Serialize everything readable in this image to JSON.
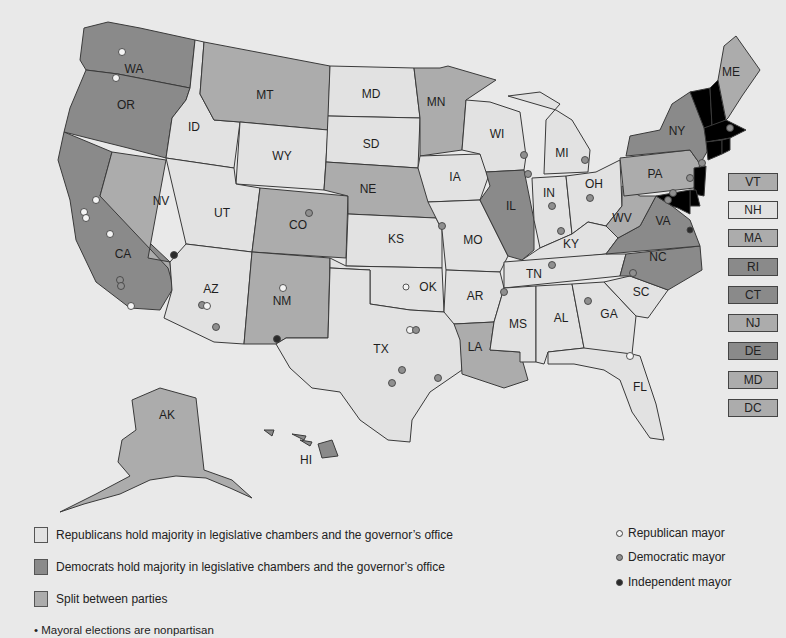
{
  "colors": {
    "republican": "#e2e2e2",
    "democrat": "#8a8a8a",
    "split": "#acacac",
    "background": "#e9e9e9",
    "republican_mayor": "#f4f4f4",
    "democratic_mayor": "#8f8f8f",
    "independent_mayor": "#2a2a2a"
  },
  "map": {
    "states": {
      "WA": {
        "label": "WA",
        "control": "democrat"
      },
      "OR": {
        "label": "OR",
        "control": "democrat"
      },
      "CA": {
        "label": "CA",
        "control": "democrat"
      },
      "NV": {
        "label": "NV",
        "control": "split"
      },
      "ID": {
        "label": "ID",
        "control": "republican"
      },
      "MT": {
        "label": "MT",
        "control": "split"
      },
      "WY": {
        "label": "WY",
        "control": "republican"
      },
      "UT": {
        "label": "UT",
        "control": "republican"
      },
      "AZ": {
        "label": "AZ",
        "control": "republican"
      },
      "CO": {
        "label": "CO",
        "control": "split"
      },
      "NM": {
        "label": "NM",
        "control": "split"
      },
      "ND": {
        "label": "MD",
        "control": "republican"
      },
      "SD": {
        "label": "SD",
        "control": "republican"
      },
      "NE": {
        "label": "NE",
        "control": "split"
      },
      "KS": {
        "label": "KS",
        "control": "republican"
      },
      "OK": {
        "label": "OK",
        "control": "republican"
      },
      "TX": {
        "label": "TX",
        "control": "republican"
      },
      "MN": {
        "label": "MN",
        "control": "split"
      },
      "IA": {
        "label": "IA",
        "control": "republican"
      },
      "MO": {
        "label": "MO",
        "control": "republican"
      },
      "AR": {
        "label": "AR",
        "control": "republican"
      },
      "LA": {
        "label": "LA",
        "control": "split"
      },
      "WI": {
        "label": "WI",
        "control": "republican"
      },
      "IL": {
        "label": "IL",
        "control": "democrat"
      },
      "MI": {
        "label": "MI",
        "control": "republican"
      },
      "IN": {
        "label": "IN",
        "control": "republican"
      },
      "OH": {
        "label": "OH",
        "control": "republican"
      },
      "KY": {
        "label": "KY",
        "control": "republican"
      },
      "TN": {
        "label": "TN",
        "control": "republican"
      },
      "MS": {
        "label": "MS",
        "control": "republican"
      },
      "AL": {
        "label": "AL",
        "control": "republican"
      },
      "GA": {
        "label": "GA",
        "control": "republican"
      },
      "FL": {
        "label": "FL",
        "control": "republican"
      },
      "SC": {
        "label": "SC",
        "control": "republican"
      },
      "NC": {
        "label": "NC",
        "control": "democrat"
      },
      "VA": {
        "label": "VA",
        "control": "democrat"
      },
      "WV": {
        "label": "WV",
        "control": "split"
      },
      "PA": {
        "label": "PA",
        "control": "split"
      },
      "NY": {
        "label": "NY",
        "control": "democrat"
      },
      "ME": {
        "label": "ME",
        "control": "split"
      },
      "AK": {
        "label": "AK",
        "control": "split"
      },
      "HI": {
        "label": "HI",
        "control": "democrat"
      }
    },
    "northeast_boxes": [
      {
        "label": "VT",
        "control": "split"
      },
      {
        "label": "NH",
        "control": "republican"
      },
      {
        "label": "MA",
        "control": "split"
      },
      {
        "label": "RI",
        "control": "democrat"
      },
      {
        "label": "CT",
        "control": "democrat"
      },
      {
        "label": "NJ",
        "control": "split"
      },
      {
        "label": "DE",
        "control": "democrat"
      },
      {
        "label": "MD",
        "control": "split"
      },
      {
        "label": "DC",
        "control": "split"
      }
    ]
  },
  "legend": {
    "party_items": [
      {
        "control": "republican",
        "label": "Republicans hold majority in legislative chambers and the governor’s office"
      },
      {
        "control": "democrat",
        "label": "Democrats hold majority in legislative chambers and the governor’s office"
      },
      {
        "control": "split",
        "label": "Split between parties"
      }
    ],
    "mayor_items": [
      {
        "type": "republican_mayor",
        "label": "Republican mayor"
      },
      {
        "type": "democratic_mayor",
        "label": "Democratic mayor"
      },
      {
        "type": "independent_mayor",
        "label": "Independent mayor"
      }
    ],
    "note": "• Mayoral elections are nonpartisan"
  }
}
